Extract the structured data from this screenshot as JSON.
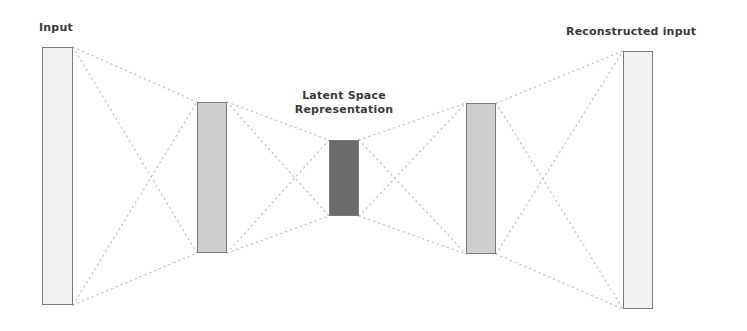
{
  "diagram": {
    "labels": {
      "input": "Input",
      "latent_line1": "Latent Space",
      "latent_line2": "Representation",
      "output": "Reconstructed input"
    },
    "layers": [
      {
        "name": "input-layer",
        "x": 42,
        "y": 47,
        "w": 31,
        "h": 258,
        "fill": "#f1f1f1",
        "role": "input"
      },
      {
        "name": "encoder-hidden-layer",
        "x": 197,
        "y": 102,
        "w": 30,
        "h": 151,
        "fill": "#cecece",
        "role": "encoder"
      },
      {
        "name": "latent-layer",
        "x": 329,
        "y": 140,
        "w": 30,
        "h": 76,
        "fill": "#6b6b6b",
        "role": "latent"
      },
      {
        "name": "decoder-hidden-layer",
        "x": 466,
        "y": 103,
        "w": 30,
        "h": 151,
        "fill": "#cecece",
        "role": "decoder"
      },
      {
        "name": "output-layer",
        "x": 623,
        "y": 51,
        "w": 30,
        "h": 258,
        "fill": "#f1f1f1",
        "role": "output"
      }
    ],
    "colors": {
      "border": "#7a7a7a",
      "connector": "#c4c4c4",
      "text": "#3a3a3a",
      "background": "#ffffff"
    }
  }
}
